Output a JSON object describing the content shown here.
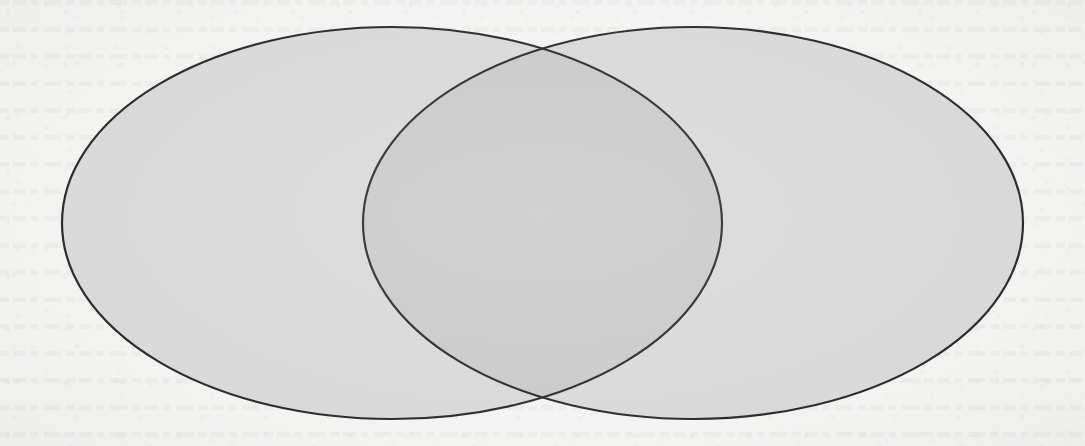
{
  "figure": {
    "type": "venn-diagram",
    "set_count": 2,
    "title": "",
    "caption": "",
    "medium": "scanned printed page",
    "background_color": "#f3f3f2",
    "stroke_color": "#262626",
    "stroke_width": 2.2
  },
  "canvas": {
    "width": 1085,
    "height": 446
  },
  "regions": {
    "left_only": {
      "label": "",
      "fill": "#d8d8d8",
      "description": "left circle exclusive region"
    },
    "right_only": {
      "label": "",
      "fill": "#d8d8d8",
      "description": "right circle exclusive region"
    },
    "intersection": {
      "label": "",
      "fill": "#c9c9c9",
      "description": "overlap / intersection lens of both circles"
    },
    "outside": {
      "label": "",
      "fill": "#f3f3f2",
      "description": "universe area outside both circles"
    }
  },
  "shapes": [
    {
      "name": "left-set",
      "label": "",
      "cx": 392,
      "cy": 223,
      "rx": 330,
      "ry": 196,
      "fill": "#d8d8d8",
      "stroke": "#262626"
    },
    {
      "name": "right-set",
      "label": "",
      "cx": 693,
      "cy": 223,
      "rx": 330,
      "ry": 196,
      "fill": "#d8d8d8",
      "stroke": "#262626"
    }
  ],
  "intersection_points": {
    "top": {
      "x": 543,
      "y": 42
    },
    "bottom": {
      "x": 543,
      "y": 405
    }
  },
  "extents": {
    "left_edge_x": 62,
    "right_edge_x": 1022,
    "top_edge_y": 27,
    "bottom_edge_y": 420
  },
  "annotations": []
}
